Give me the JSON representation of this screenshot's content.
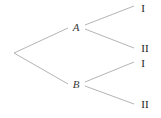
{
  "diagram": {
    "type": "tree",
    "title": "",
    "stroke_color": "#b4b4b4",
    "stroke_width": 1,
    "background": "#ffffff",
    "nodes": [
      {
        "id": "root",
        "label": "",
        "x": 14,
        "y": 53,
        "kind": "root"
      },
      {
        "id": "A",
        "label": "A",
        "x": 76,
        "y": 27,
        "kind": "branch"
      },
      {
        "id": "B",
        "label": "B",
        "x": 76,
        "y": 84,
        "kind": "branch"
      }
    ],
    "leaves": [
      {
        "id": "A-I",
        "label": "I",
        "x": 143,
        "y": 8,
        "parent": "A"
      },
      {
        "id": "A-II",
        "label": "II",
        "x": 145,
        "y": 48,
        "parent": "A"
      },
      {
        "id": "B-I",
        "label": "I",
        "x": 143,
        "y": 63,
        "parent": "B"
      },
      {
        "id": "B-II",
        "label": "II",
        "x": 145,
        "y": 104,
        "parent": "B"
      }
    ],
    "edges": [
      {
        "id": "root-A",
        "from": "root",
        "to": "A",
        "x1": 14,
        "y1": 53,
        "x2": 68,
        "y2": 28
      },
      {
        "id": "root-B",
        "from": "root",
        "to": "B",
        "x1": 14,
        "y1": 53,
        "x2": 68,
        "y2": 84
      },
      {
        "id": "A-I",
        "from": "A",
        "to": "A-I",
        "x1": 85,
        "y1": 25,
        "x2": 134,
        "y2": 6
      },
      {
        "id": "A-II",
        "from": "A",
        "to": "A-II",
        "x1": 85,
        "y1": 29,
        "x2": 134,
        "y2": 48
      },
      {
        "id": "B-I",
        "from": "B",
        "to": "B-I",
        "x1": 85,
        "y1": 82,
        "x2": 134,
        "y2": 62
      },
      {
        "id": "B-II",
        "from": "B",
        "to": "B-II",
        "x1": 85,
        "y1": 86,
        "x2": 134,
        "y2": 104
      }
    ]
  }
}
